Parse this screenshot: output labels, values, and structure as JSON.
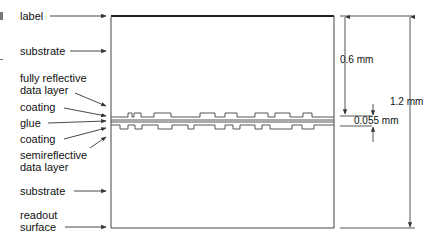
{
  "diagram": {
    "layer_labels": [
      {
        "id": "label",
        "text": "label"
      },
      {
        "id": "substrate-top",
        "text": "substrate"
      },
      {
        "id": "fully-reflective",
        "line1": "fully reflective",
        "line2": "data layer"
      },
      {
        "id": "coating-top",
        "text": "coating"
      },
      {
        "id": "glue",
        "text": "glue"
      },
      {
        "id": "coating-bottom",
        "text": "coating"
      },
      {
        "id": "semireflective",
        "line1": "semireflective",
        "line2": "data layer"
      },
      {
        "id": "substrate-bottom",
        "text": "substrate"
      },
      {
        "id": "readout",
        "line1": "readout",
        "line2": "surface"
      }
    ],
    "dimensions": {
      "half_thickness": "0.6 mm",
      "total_thickness": "1.2 mm",
      "bond_layer": "0.055 mm"
    },
    "colors": {
      "line": "#333333",
      "label_band": "#222222",
      "text": "#111111"
    }
  }
}
